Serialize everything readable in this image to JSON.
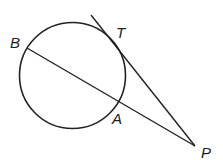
{
  "diagram": {
    "type": "geometry",
    "stroke_color": "#222222",
    "background": "#ffffff",
    "circle": {
      "cx": 72.5,
      "cy": 75.5,
      "r": 53
    },
    "points": {
      "B": {
        "label": "B",
        "x": 27,
        "y": 48
      },
      "A": {
        "label": "A",
        "x": 119,
        "y": 102
      },
      "T": {
        "label": "T",
        "x": 120,
        "y": 56
      },
      "P": {
        "label": "P",
        "x": 195,
        "y": 146
      }
    },
    "segments": [
      {
        "name": "secant-BP",
        "from": "B",
        "to": "P"
      },
      {
        "name": "tangent-PT",
        "from": "P",
        "to_extended": {
          "x": 91,
          "y": 15
        }
      }
    ],
    "labels": {
      "B": "B",
      "T": "T",
      "A": "A",
      "P": "P"
    }
  }
}
